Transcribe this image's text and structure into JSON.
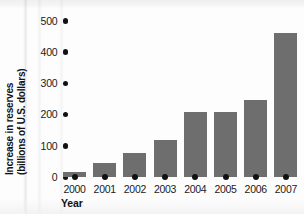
{
  "figure": {
    "background_color": "#fdfdfd",
    "bar_color": "#6e6e6e",
    "tick_color": "#111111",
    "text_color": "#1a1a1a"
  },
  "chart_data": {
    "type": "bar",
    "title": "",
    "xlabel": "Year",
    "ylabel_line1": "Increase in reserves",
    "ylabel_line2": "(billions of U.S. dollars)",
    "categories": [
      "2000",
      "2001",
      "2002",
      "2003",
      "2004",
      "2005",
      "2006",
      "2007"
    ],
    "values": [
      16,
      45,
      77,
      118,
      208,
      208,
      247,
      463
    ],
    "yticks": [
      "500",
      "400",
      "300",
      "200",
      "100",
      "0"
    ],
    "ytick_values": [
      500,
      400,
      300,
      200,
      100,
      0
    ],
    "ylim": [
      0,
      500
    ],
    "grid": false,
    "legend": false,
    "tick_style": "dots"
  }
}
